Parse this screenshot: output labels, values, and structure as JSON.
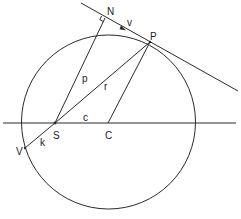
{
  "diagram": {
    "title": "",
    "colors": {
      "stroke": "#2a2a2a",
      "text": "#222222",
      "background": "#ffffff"
    },
    "labels": {
      "N": "N",
      "v": "v",
      "P": "P",
      "p": "p",
      "r": "r",
      "S": "S",
      "c": "c",
      "C": "C",
      "V": "V",
      "k": "k"
    },
    "points": {
      "N": [
        105,
        18
      ],
      "v_arrow": [
        125,
        29
      ],
      "P": [
        150,
        42
      ],
      "S": [
        55,
        123
      ],
      "C": [
        108,
        123
      ],
      "V": [
        25,
        148
      ]
    },
    "circle": {
      "center": [
        108,
        122
      ],
      "radius": 87
    }
  }
}
